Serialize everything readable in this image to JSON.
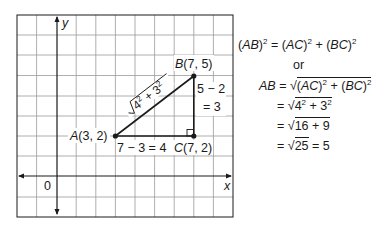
{
  "graph": {
    "axes": {
      "x_label": "x",
      "y_label": "y",
      "origin_label": "0"
    },
    "grid": {
      "left": 17,
      "top": 15,
      "right": 233,
      "bottom": 217,
      "cell": 19.6,
      "origin_px": [
        57,
        176
      ]
    },
    "points": {
      "A": {
        "label": "A(3, 2)",
        "name": "A",
        "coords": "(3, 2)",
        "x": 3,
        "y": 2
      },
      "B": {
        "label": "B(7, 5)",
        "name": "B",
        "coords": "(7, 5)",
        "x": 7,
        "y": 5
      },
      "C": {
        "label": "C(7, 2)",
        "name": "C",
        "coords": "(7, 2)",
        "x": 7,
        "y": 2
      }
    },
    "segment_labels": {
      "AC": "7 − 3 = 4",
      "BC_line1": "5 − 2",
      "BC_line2": "= 3",
      "AB": "√4² + 3²"
    }
  },
  "equations": {
    "line1": "(AB)² = (AC)² + (BC)²",
    "or": "or",
    "line2": "AB = √((AC)² + (BC)²)",
    "line3": "= √(4² + 3²)",
    "line4": "= √(16 + 9)",
    "line5": "= √25 = 5"
  },
  "colors": {
    "grid": "#9a9a9a",
    "ink": "#1a1a1a",
    "background": "#ffffff"
  }
}
